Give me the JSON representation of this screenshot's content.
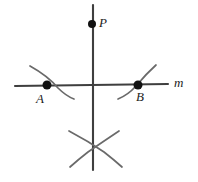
{
  "figure": {
    "name": "perpendicular-bisector-construction",
    "background_color": "#ffffff",
    "stroke_color": "#3f3f3f",
    "dot_color": "#111111",
    "label_color": "#1c1c1c"
  },
  "labels": {
    "point_p": "P",
    "point_a": "A",
    "point_b": "B",
    "line_m": "m"
  },
  "geometry": {
    "line_m": {
      "x1": 15,
      "y1": 86,
      "x2": 168,
      "y2": 84
    },
    "vertical_line": {
      "x1": 93,
      "y1": 5,
      "x2": 93,
      "y2": 170
    },
    "point_p": {
      "cx": 92,
      "cy": 24,
      "r": 4
    },
    "point_a": {
      "cx": 47,
      "cy": 85,
      "r": 4.5
    },
    "point_b": {
      "cx": 138,
      "cy": 85,
      "r": 4.5
    },
    "arc_a": "M 30,66 Q 48,76 58,88 Q 66,96 74,99",
    "arc_b": "M 118,99 Q 128,95 136,86 Q 146,74 156,65",
    "arc_bottom_left": "M 69,131 Q 88,141 104,152 Q 113,159 122,167",
    "arc_bottom_right": "M 119,131 Q 104,141 88,152 Q 79,159 70,167"
  }
}
